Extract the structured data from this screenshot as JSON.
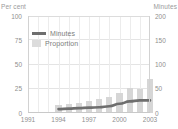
{
  "title_remnant": "",
  "axes": {
    "left_caption": "Per cent",
    "right_caption": "Minutes",
    "left_ticks": [
      "100",
      "75",
      "50",
      "25",
      "0"
    ],
    "right_ticks": [
      "200",
      "150",
      "100",
      "50",
      "0"
    ],
    "x_ticks": [
      "1991",
      "1994",
      "1997",
      "2000",
      "2003"
    ]
  },
  "legend": {
    "items": [
      {
        "label": "Minutes",
        "type": "line",
        "color": "#6e6e6e"
      },
      {
        "label": "Proportion",
        "type": "bar",
        "color": "#dcdcdc"
      }
    ]
  },
  "colors": {
    "bar": "#d6d6d6",
    "line": "#6e6e6e",
    "grid": "#e4e4e4",
    "text": "#8f8f8f"
  },
  "chart_data": {
    "type": "bar",
    "title": "",
    "xlabel": "",
    "ylabel": "Per cent",
    "y2label": "Minutes",
    "ylim": [
      0,
      100
    ],
    "y2lim": [
      0,
      200
    ],
    "xlim": [
      1991,
      2003
    ],
    "grid": true,
    "legend_position": "upper-left-inside",
    "categories": [
      "1991",
      "1992",
      "1993",
      "1994",
      "1995",
      "1996",
      "1997",
      "1998",
      "1999",
      "2000",
      "2001",
      "2002",
      "2003"
    ],
    "series": [
      {
        "name": "Proportion",
        "type": "bar",
        "axis": "left",
        "unit": "per cent",
        "values": [
          null,
          null,
          null,
          8,
          9,
          10,
          12,
          14,
          16,
          21,
          26,
          25,
          35
        ]
      },
      {
        "name": "Minutes",
        "type": "line",
        "axis": "right",
        "unit": "minutes",
        "values": [
          null,
          null,
          null,
          8,
          9,
          10,
          11,
          12,
          14,
          19,
          24,
          26,
          26
        ]
      }
    ]
  }
}
